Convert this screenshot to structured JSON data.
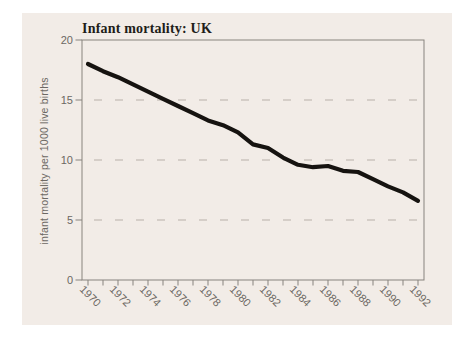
{
  "chart_data": {
    "type": "line",
    "title": "Infant mortality: UK",
    "ylabel": "infant mortality per 1000 live births",
    "xlabel": "",
    "x": [
      1970,
      1971,
      1972,
      1973,
      1974,
      1975,
      1976,
      1977,
      1978,
      1979,
      1980,
      1981,
      1982,
      1983,
      1984,
      1985,
      1986,
      1987,
      1988,
      1989,
      1990,
      1991,
      1992
    ],
    "values": [
      18.0,
      17.4,
      16.9,
      16.3,
      15.7,
      15.1,
      14.5,
      13.9,
      13.3,
      12.9,
      12.3,
      11.3,
      11.0,
      10.2,
      9.6,
      9.4,
      9.5,
      9.1,
      9.0,
      8.4,
      7.8,
      7.3,
      6.6
    ],
    "series_name": "Infant mortality per 1000 live births, UK",
    "ylim": [
      0,
      20
    ],
    "yticks": [
      0,
      5,
      10,
      15,
      20
    ],
    "xticks_labeled": [
      1970,
      1972,
      1974,
      1976,
      1978,
      1980,
      1982,
      1984,
      1986,
      1988,
      1990,
      1992
    ],
    "xticks_minor_every_year": true,
    "grid_y": [
      5,
      10,
      15
    ],
    "grid_style": "dashed",
    "legend": "none",
    "colors": {
      "line": "#161310",
      "grid": "#b7b0a9",
      "axis": "#87837e",
      "tick_text": "#6c6863",
      "title_text": "#211d19",
      "panel_bg": "#f2ece7",
      "page_bg": "#ffffff"
    }
  }
}
